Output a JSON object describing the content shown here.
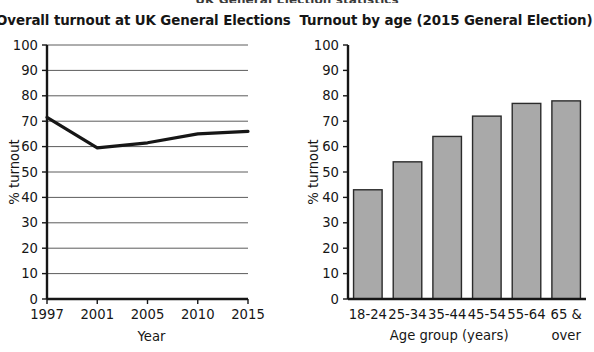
{
  "page": {
    "cut_off_header": "UK General Election statistics",
    "background_color": "#ffffff",
    "ink_color": "#161616"
  },
  "charts": [
    {
      "panel": "left",
      "title": "Overall turnout at UK General Elections",
      "ylabel": "% turnout",
      "xlabel": "Year"
    },
    {
      "panel": "right",
      "title": "Turnout by age (2015 General Election)",
      "ylabel": "% turnout",
      "xlabel": "Age group (years)"
    }
  ],
  "chart_data": [
    {
      "type": "line",
      "title": "Overall turnout at UK General Elections",
      "xlabel": "Year",
      "ylabel": "% turnout",
      "x": [
        "1997",
        "2001",
        "2005",
        "2010",
        "2015"
      ],
      "values": [
        71.5,
        59.5,
        61.5,
        65.0,
        66.0
      ],
      "ylim": [
        0,
        100
      ],
      "yticks": [
        0,
        10,
        20,
        30,
        40,
        50,
        60,
        70,
        80,
        90,
        100
      ],
      "grid": "horizontal",
      "legend": "none",
      "line_color": "#161616",
      "line_width": 3.2
    },
    {
      "type": "bar",
      "title": "Turnout by age (2015 General Election)",
      "xlabel": "Age group (years)",
      "ylabel": "% turnout",
      "categories": [
        "18-24",
        "25-34",
        "35-44",
        "45-54",
        "55-64",
        "65 & over"
      ],
      "category_lines": [
        [
          "18-24"
        ],
        [
          "25-34"
        ],
        [
          "35-44"
        ],
        [
          "45-54"
        ],
        [
          "55-64"
        ],
        [
          "65 &",
          "over"
        ]
      ],
      "values": [
        43,
        54,
        64,
        72,
        77,
        78
      ],
      "ylim": [
        0,
        100
      ],
      "yticks": [
        0,
        10,
        20,
        30,
        40,
        50,
        60,
        70,
        80,
        90,
        100
      ],
      "grid": "none",
      "legend": "none",
      "bar_fill": "#a9a9a9",
      "bar_stroke": "#2b2b2b"
    }
  ]
}
